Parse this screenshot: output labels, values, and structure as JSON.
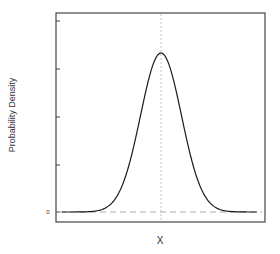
{
  "chart_data": {
    "type": "line",
    "title": "",
    "xlabel": "X",
    "ylabel": "Probability Density",
    "y_tick_labels": [
      "0",
      "",
      "",
      "",
      ""
    ],
    "y_tick_count": 5,
    "x_tick_labels": [],
    "grid": false,
    "legend": null,
    "series": [
      {
        "name": "normal density",
        "shape": "gaussian",
        "mean_x_px": 161,
        "sigma_px": 20.5,
        "x_range_px": [
          62,
          257
        ]
      }
    ],
    "annotations": [
      {
        "type": "vline",
        "style": "dotted",
        "position": "mean"
      },
      {
        "type": "hline",
        "style": "dashed",
        "value": 0
      }
    ]
  },
  "labels": {
    "x_axis": "X",
    "y_axis": "Probability Density",
    "y_zero_tick": "0"
  },
  "colors": {
    "curve": "#1a1a1a",
    "frame": "#444444",
    "reference_lines": "#999999"
  }
}
